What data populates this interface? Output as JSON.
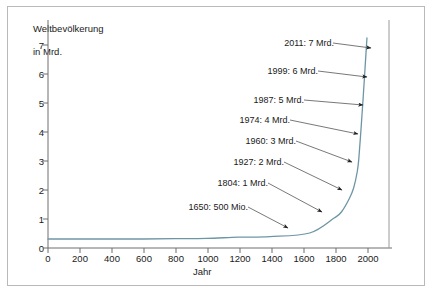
{
  "chart_data": {
    "type": "line",
    "title": "",
    "subtitle": "",
    "ylabel": "Weltbevölkerung\nin Mrd.",
    "xlabel": "Jahr",
    "xlim": [
      0,
      2150
    ],
    "ylim": [
      0,
      7.6
    ],
    "xticks": [
      0,
      200,
      400,
      600,
      800,
      1000,
      1200,
      1400,
      1600,
      1800,
      2000
    ],
    "yticks": [
      0,
      1,
      2,
      3,
      4,
      5,
      6,
      7
    ],
    "grid": false,
    "legend": null,
    "series": [
      {
        "name": "Weltbevölkerung",
        "color": "#6d96a5",
        "x": [
          0,
          200,
          400,
          600,
          800,
          1000,
          1200,
          1400,
          1650,
          1804,
          1850,
          1900,
          1927,
          1950,
          1960,
          1974,
          1987,
          1999,
          2011
        ],
        "y": [
          0.3,
          0.3,
          0.3,
          0.3,
          0.31,
          0.32,
          0.36,
          0.38,
          0.5,
          1.0,
          1.2,
          1.65,
          2.0,
          2.55,
          3.0,
          4.0,
          5.0,
          6.0,
          7.0
        ]
      }
    ],
    "annotations": [
      {
        "label": "2011: 7 Mrd.",
        "year": 2011,
        "value": 7.0,
        "value_unit": "Mrd.",
        "text_x": 278,
        "text_y": 38,
        "arrow_x1": 333,
        "arrow_y1": 43,
        "arrow_x2": 371,
        "arrow_y2": 48
      },
      {
        "label": "1999: 6 Mrd.",
        "year": 1999,
        "value": 6.0,
        "value_unit": "Mrd.",
        "text_x": 262,
        "text_y": 66,
        "arrow_x1": 318,
        "arrow_y1": 71,
        "arrow_x2": 367,
        "arrow_y2": 77
      },
      {
        "label": "1987: 5 Mrd.",
        "year": 1987,
        "value": 5.0,
        "value_unit": "Mrd.",
        "text_x": 248,
        "text_y": 95,
        "arrow_x1": 304,
        "arrow_y1": 100,
        "arrow_x2": 363,
        "arrow_y2": 105
      },
      {
        "label": "1974: 4 Mrd.",
        "year": 1974,
        "value": 4.0,
        "value_unit": "Mrd.",
        "text_x": 234,
        "text_y": 115,
        "arrow_x1": 290,
        "arrow_y1": 120,
        "arrow_x2": 358,
        "arrow_y2": 134
      },
      {
        "label": "1960: 3 Mrd.",
        "year": 1960,
        "value": 3.0,
        "value_unit": "Mrd.",
        "text_x": 240,
        "text_y": 136,
        "arrow_x1": 296,
        "arrow_y1": 141,
        "arrow_x2": 352,
        "arrow_y2": 162
      },
      {
        "label": "1927: 2 Mrd.",
        "year": 1927,
        "value": 2.0,
        "value_unit": "Mrd.",
        "text_x": 228,
        "text_y": 157,
        "arrow_x1": 284,
        "arrow_y1": 162,
        "arrow_x2": 342,
        "arrow_y2": 190
      },
      {
        "label": "1804: 1 Mrd.",
        "year": 1804,
        "value": 1.0,
        "value_unit": "Mrd.",
        "text_x": 212,
        "text_y": 178,
        "arrow_x1": 268,
        "arrow_y1": 183,
        "arrow_x2": 322,
        "arrow_y2": 212
      },
      {
        "label": "1650: 500 Mio.",
        "year": 1650,
        "value": 0.5,
        "value_unit": "Mio.",
        "text_x": 176,
        "text_y": 202,
        "arrow_x1": 248,
        "arrow_y1": 207,
        "arrow_x2": 288,
        "arrow_y2": 228
      }
    ]
  },
  "axes": {
    "y_title_line1": "Weltbevölkerung",
    "y_title_line2": "in Mrd.",
    "x_title": "Jahr",
    "yticks": [
      "7",
      "6",
      "5",
      "4",
      "3",
      "2",
      "1",
      "0"
    ],
    "xticks": [
      "0",
      "200",
      "400",
      "600",
      "800",
      "1000",
      "1200",
      "1400",
      "1600",
      "1800",
      "2000"
    ]
  },
  "colors": {
    "curve": "#6d96a5",
    "axis": "#6e6e6e",
    "frame": "#b9b9b9",
    "text": "#1a1a1a",
    "background": "#ffffff"
  }
}
